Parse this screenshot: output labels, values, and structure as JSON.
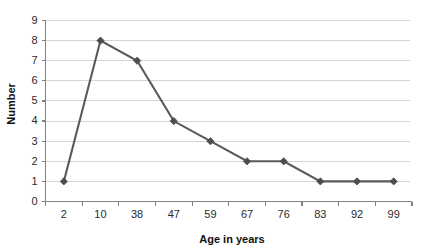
{
  "chart_data": {
    "type": "line",
    "title": "",
    "subtitle": "",
    "xlabel": "Age in years",
    "ylabel": "Number",
    "categories": [
      "2",
      "10",
      "38",
      "47",
      "59",
      "67",
      "76",
      "83",
      "92",
      "99"
    ],
    "values": [
      1,
      8,
      7,
      4,
      3,
      2,
      2,
      1,
      1,
      1
    ],
    "series": [
      {
        "name": "Number",
        "values": [
          1,
          8,
          7,
          4,
          3,
          2,
          2,
          1,
          1,
          1
        ]
      }
    ],
    "ylim": [
      0,
      9
    ],
    "yticks": [
      0,
      1,
      2,
      3,
      4,
      5,
      6,
      7,
      8,
      9
    ],
    "ytick_labels": [
      "0",
      "1",
      "2",
      "3",
      "4",
      "5",
      "6",
      "7",
      "8",
      "9"
    ],
    "xtick_labels": [
      "2",
      "10",
      "38",
      "47",
      "59",
      "67",
      "76",
      "83",
      "92",
      "99"
    ],
    "grid": true,
    "grid_axis": "y",
    "legend": false,
    "legend_position": "none",
    "marker": "diamond",
    "annotations": []
  },
  "style": {
    "background_color": "#ffffff",
    "series_color": "#5a5a5a",
    "marker_color": "#4d4d4d",
    "gridline_color": "#d4d4d4",
    "axis_color": "#808080",
    "text_color": "#2b2b2b",
    "title_color": "#101010"
  }
}
